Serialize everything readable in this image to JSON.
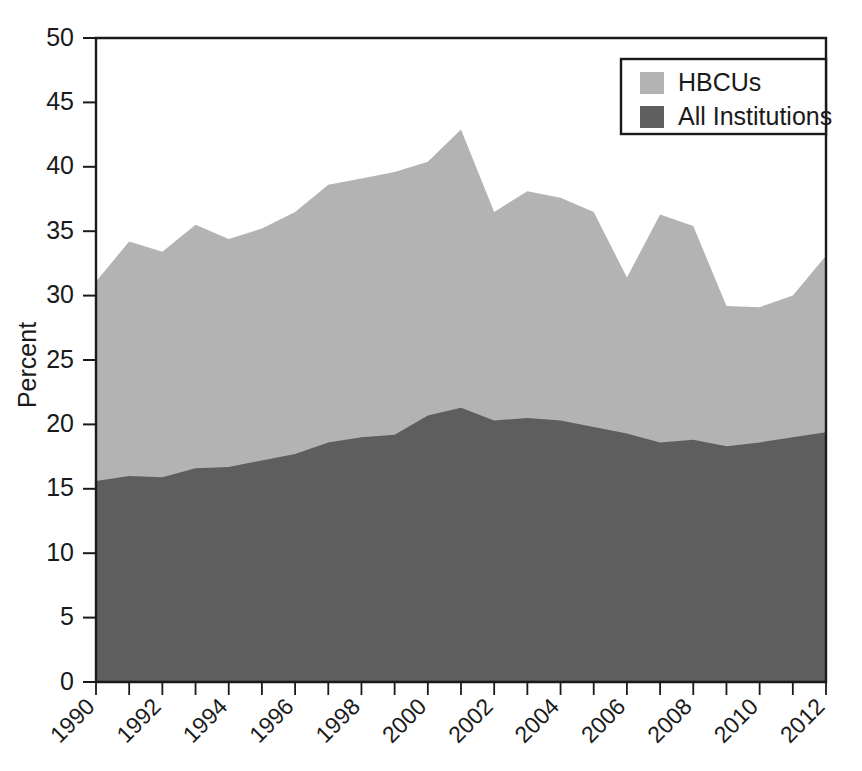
{
  "chart_data": {
    "type": "area",
    "title": "",
    "xlabel": "",
    "ylabel": "Percent",
    "xlim": [
      1990,
      2012
    ],
    "ylim": [
      0,
      50
    ],
    "ytick_values": [
      0,
      5,
      10,
      15,
      20,
      25,
      30,
      35,
      40,
      45,
      50
    ],
    "ytick_labels": [
      "0",
      "5",
      "10",
      "15",
      "20",
      "25",
      "30",
      "35",
      "40",
      "45",
      "50"
    ],
    "xtick_values": [
      1990,
      1991,
      1992,
      1993,
      1994,
      1995,
      1996,
      1997,
      1998,
      1999,
      2000,
      2001,
      2002,
      2003,
      2004,
      2005,
      2006,
      2007,
      2008,
      2009,
      2010,
      2011,
      2012
    ],
    "xtick_labels_shown": [
      "1990",
      "",
      "1992",
      "",
      "1994",
      "",
      "1996",
      "",
      "1998",
      "",
      "2000",
      "",
      "2002",
      "",
      "2004",
      "",
      "2006",
      "",
      "2008",
      "",
      "2010",
      "",
      "2012"
    ],
    "xtick_label_rotation_deg": 45,
    "grid": false,
    "stacked": false,
    "legend_position": "top-right",
    "x": [
      1990,
      1991,
      1992,
      1993,
      1994,
      1995,
      1996,
      1997,
      1998,
      1999,
      2000,
      2001,
      2002,
      2003,
      2004,
      2005,
      2006,
      2007,
      2008,
      2009,
      2010,
      2011,
      2012
    ],
    "series": [
      {
        "name": "HBCUs",
        "color": "#b3b3b3",
        "values": [
          31.1,
          34.2,
          33.4,
          35.5,
          34.4,
          35.2,
          36.5,
          38.6,
          39.1,
          39.6,
          40.4,
          42.9,
          36.5,
          38.1,
          37.6,
          36.5,
          31.4,
          36.3,
          35.4,
          29.2,
          29.1,
          30.0,
          33.1
        ]
      },
      {
        "name": "All Institutions",
        "color": "#5e5e5e",
        "values": [
          15.6,
          16.0,
          15.9,
          16.6,
          16.7,
          17.2,
          17.7,
          18.6,
          19.0,
          19.2,
          20.7,
          21.3,
          20.3,
          20.5,
          20.3,
          19.8,
          19.3,
          18.6,
          18.8,
          18.3,
          18.6,
          19.0,
          19.4
        ]
      }
    ],
    "legend_entries": [
      {
        "label": "HBCUs",
        "color": "#b3b3b3"
      },
      {
        "label": "All Institutions",
        "color": "#5e5e5e"
      }
    ]
  },
  "axes": {
    "ylabel": "Percent"
  },
  "legend": {
    "items": [
      {
        "label": "HBCUs"
      },
      {
        "label": "All Institutions"
      }
    ]
  }
}
